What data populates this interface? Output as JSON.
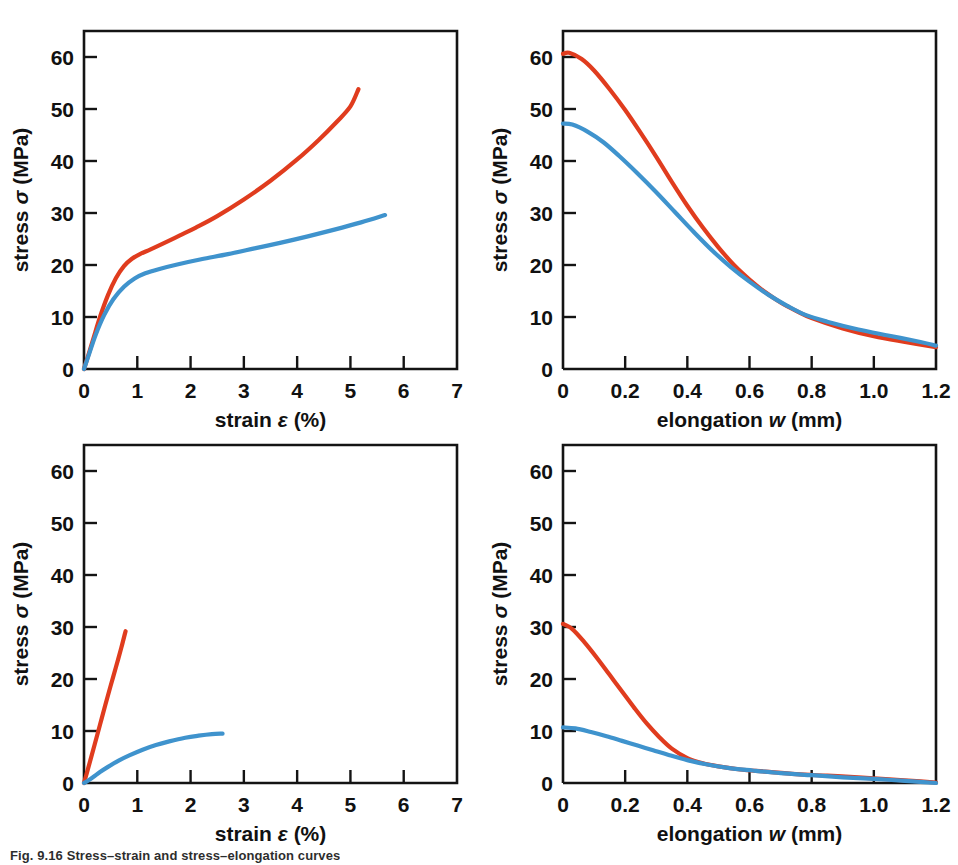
{
  "figure": {
    "caption": "Fig. 9.16   Stress–strain and stress–elongation curves",
    "colors": {
      "series_red": "#e03c1e",
      "series_blue": "#3f93cd",
      "axis": "#141414",
      "background": "#ffffff"
    },
    "layout": {
      "rows": 2,
      "columns": 2,
      "panel_order": [
        "top-left",
        "top-right",
        "bottom-left",
        "bottom-right"
      ]
    }
  },
  "labels": {
    "stress_axis": {
      "prefix": "stress ",
      "symbol": "σ",
      "suffix": " (MPa)"
    },
    "strain_axis": {
      "prefix": "strain ",
      "symbol": "ε",
      "suffix": " (%)"
    },
    "elongation_axis": {
      "prefix": "elongation ",
      "symbol": "w",
      "suffix": " (mm)"
    }
  },
  "chart_data": [
    {
      "id": "top-left",
      "type": "line",
      "title": "",
      "xlabel": "strain ε (%)",
      "ylabel": "stress σ (MPa)",
      "xlim": [
        0,
        7
      ],
      "ylim": [
        0,
        65
      ],
      "xticks": [
        0,
        1,
        2,
        3,
        4,
        5,
        6,
        7
      ],
      "xticklabels": [
        "0",
        "1",
        "2",
        "3",
        "4",
        "5",
        "6",
        "7"
      ],
      "yticks": [
        0,
        10,
        20,
        30,
        40,
        50,
        60
      ],
      "yticklabels": [
        "0",
        "10",
        "20",
        "30",
        "40",
        "50",
        "60"
      ],
      "grid": false,
      "legend": "none",
      "series": [
        {
          "name": "red",
          "color": "#e03c1e",
          "x": [
            0.0,
            0.08,
            0.18,
            0.3,
            0.45,
            0.6,
            0.75,
            0.9,
            1.05,
            1.25,
            1.5,
            1.8,
            2.1,
            2.5,
            3.0,
            3.5,
            4.0,
            4.4,
            4.75,
            5.0,
            5.15
          ],
          "y": [
            0.0,
            2.6,
            6.0,
            10.0,
            14.2,
            17.5,
            19.8,
            21.2,
            22.1,
            23.0,
            24.2,
            25.7,
            27.2,
            29.4,
            32.6,
            36.2,
            40.3,
            44.0,
            47.6,
            50.5,
            53.8
          ]
        },
        {
          "name": "blue",
          "color": "#3f93cd",
          "x": [
            0.0,
            0.1,
            0.22,
            0.38,
            0.55,
            0.75,
            0.95,
            1.15,
            1.4,
            1.75,
            2.2,
            2.7,
            3.2,
            3.7,
            4.2,
            4.7,
            5.2,
            5.65
          ],
          "y": [
            0.0,
            3.0,
            6.6,
            10.4,
            13.4,
            15.8,
            17.4,
            18.4,
            19.2,
            20.1,
            21.1,
            22.1,
            23.2,
            24.3,
            25.5,
            26.8,
            28.2,
            29.6
          ]
        }
      ]
    },
    {
      "id": "top-right",
      "type": "line",
      "title": "",
      "xlabel": "elongation w (mm)",
      "ylabel": "stress σ (MPa)",
      "xlim": [
        0,
        1.2
      ],
      "ylim": [
        0,
        65
      ],
      "xticks": [
        0,
        0.2,
        0.4,
        0.6,
        0.8,
        1.0,
        1.2
      ],
      "xticklabels": [
        "0",
        "0.2",
        "0.4",
        "0.6",
        "0.8",
        "1.0",
        "1.2"
      ],
      "yticks": [
        0,
        10,
        20,
        30,
        40,
        50,
        60
      ],
      "yticklabels": [
        "0",
        "10",
        "20",
        "30",
        "40",
        "50",
        "60"
      ],
      "grid": false,
      "legend": "none",
      "series": [
        {
          "name": "red",
          "color": "#e03c1e",
          "x": [
            0.0,
            0.02,
            0.06,
            0.1,
            0.15,
            0.2,
            0.25,
            0.3,
            0.35,
            0.4,
            0.45,
            0.5,
            0.55,
            0.6,
            0.65,
            0.7,
            0.75,
            0.8,
            0.9,
            1.0,
            1.1,
            1.2
          ],
          "y": [
            60.6,
            60.8,
            59.6,
            57.4,
            53.8,
            49.8,
            45.4,
            40.8,
            36.0,
            31.4,
            27.2,
            23.4,
            20.0,
            17.2,
            14.8,
            12.8,
            11.2,
            9.8,
            7.8,
            6.3,
            5.2,
            4.2
          ]
        },
        {
          "name": "blue",
          "color": "#3f93cd",
          "x": [
            0.0,
            0.03,
            0.08,
            0.13,
            0.18,
            0.24,
            0.3,
            0.36,
            0.42,
            0.48,
            0.54,
            0.6,
            0.66,
            0.72,
            0.78,
            0.85,
            0.95,
            1.05,
            1.15,
            1.2
          ],
          "y": [
            47.2,
            47.0,
            45.6,
            43.6,
            41.0,
            37.6,
            34.0,
            30.2,
            26.4,
            22.8,
            19.6,
            16.8,
            14.3,
            12.2,
            10.4,
            9.1,
            7.6,
            6.4,
            5.2,
            4.5
          ]
        }
      ]
    },
    {
      "id": "bottom-left",
      "type": "line",
      "title": "",
      "xlabel": "strain ε (%)",
      "ylabel": "stress σ (MPa)",
      "xlim": [
        0,
        7
      ],
      "ylim": [
        0,
        65
      ],
      "xticks": [
        0,
        1,
        2,
        3,
        4,
        5,
        6,
        7
      ],
      "xticklabels": [
        "0",
        "1",
        "2",
        "3",
        "4",
        "5",
        "6",
        "7"
      ],
      "yticks": [
        0,
        10,
        20,
        30,
        40,
        50,
        60
      ],
      "yticklabels": [
        "0",
        "10",
        "20",
        "30",
        "40",
        "50",
        "60"
      ],
      "grid": false,
      "legend": "none",
      "series": [
        {
          "name": "red",
          "color": "#e03c1e",
          "x": [
            0.0,
            0.05,
            0.12,
            0.2,
            0.3,
            0.4,
            0.5,
            0.6,
            0.7,
            0.78
          ],
          "y": [
            0.0,
            1.8,
            4.4,
            7.4,
            11.2,
            15.0,
            18.7,
            22.3,
            26.0,
            29.2
          ]
        },
        {
          "name": "blue",
          "color": "#3f93cd",
          "x": [
            0.0,
            0.08,
            0.18,
            0.3,
            0.45,
            0.65,
            0.85,
            1.1,
            1.35,
            1.6,
            1.9,
            2.15,
            2.4,
            2.6
          ],
          "y": [
            0.0,
            0.5,
            1.2,
            2.1,
            3.1,
            4.3,
            5.3,
            6.4,
            7.3,
            8.0,
            8.7,
            9.1,
            9.4,
            9.5
          ]
        }
      ]
    },
    {
      "id": "bottom-right",
      "type": "line",
      "title": "",
      "xlabel": "elongation w (mm)",
      "ylabel": "stress σ (MPa)",
      "xlim": [
        0,
        1.2
      ],
      "ylim": [
        0,
        65
      ],
      "xticks": [
        0,
        0.2,
        0.4,
        0.6,
        0.8,
        1.0,
        1.2
      ],
      "xticklabels": [
        "0",
        "0.2",
        "0.4",
        "0.6",
        "0.8",
        "1.0",
        "1.2"
      ],
      "yticks": [
        0,
        10,
        20,
        30,
        40,
        50,
        60
      ],
      "yticklabels": [
        "0",
        "10",
        "20",
        "30",
        "40",
        "50",
        "60"
      ],
      "grid": false,
      "legend": "none",
      "series": [
        {
          "name": "red",
          "color": "#e03c1e",
          "x": [
            0.0,
            0.03,
            0.07,
            0.11,
            0.15,
            0.19,
            0.23,
            0.27,
            0.31,
            0.35,
            0.4,
            0.45,
            0.5,
            0.57,
            0.65,
            0.75,
            0.85,
            0.95,
            1.05,
            1.15,
            1.2
          ],
          "y": [
            30.6,
            29.6,
            27.0,
            24.0,
            20.8,
            17.6,
            14.4,
            11.4,
            8.8,
            6.6,
            4.8,
            3.8,
            3.2,
            2.6,
            2.2,
            1.7,
            1.4,
            1.1,
            0.7,
            0.3,
            0.1
          ]
        },
        {
          "name": "blue",
          "color": "#3f93cd",
          "x": [
            0.0,
            0.04,
            0.09,
            0.14,
            0.19,
            0.24,
            0.29,
            0.34,
            0.4,
            0.46,
            0.53,
            0.61,
            0.7,
            0.8,
            0.9,
            1.0,
            1.1,
            1.2
          ],
          "y": [
            10.7,
            10.5,
            9.8,
            9.0,
            8.1,
            7.2,
            6.3,
            5.4,
            4.4,
            3.6,
            2.9,
            2.4,
            1.9,
            1.5,
            1.1,
            0.8,
            0.4,
            0.0
          ]
        }
      ]
    }
  ]
}
